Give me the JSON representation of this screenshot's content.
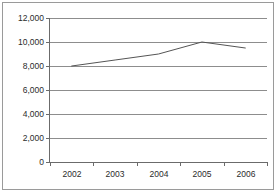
{
  "chart_data": {
    "type": "line",
    "title": "",
    "subtitle": "",
    "xlabel": "",
    "ylabel": "",
    "categories": [
      "2002",
      "2003",
      "2004",
      "2005",
      "2006"
    ],
    "x": [
      2002,
      2003,
      2004,
      2005,
      2006
    ],
    "values": [
      8000,
      8500,
      9000,
      10000,
      9500
    ],
    "series": [
      {
        "name": "",
        "values": [
          8000,
          8500,
          9000,
          10000,
          9500
        ]
      }
    ],
    "ylim": [
      0,
      12000
    ],
    "yticks": [
      0,
      2000,
      4000,
      6000,
      8000,
      10000,
      12000
    ],
    "ytick_labels": [
      "0",
      "2,000",
      "4,000",
      "6,000",
      "8,000",
      "10,000",
      "12,000"
    ],
    "xtick_labels": [
      "2002",
      "2003",
      "2004",
      "2005",
      "2006"
    ],
    "grid": true,
    "grid_axis": "y",
    "legend": false,
    "legend_position": "none",
    "markers": false,
    "line_color": "#555555",
    "grid_color": "#8d8d8d",
    "axis_color": "#6b6b6b",
    "border_color": "#9a9a9a",
    "background": "#ffffff",
    "text_color": "#2b2b2b"
  }
}
